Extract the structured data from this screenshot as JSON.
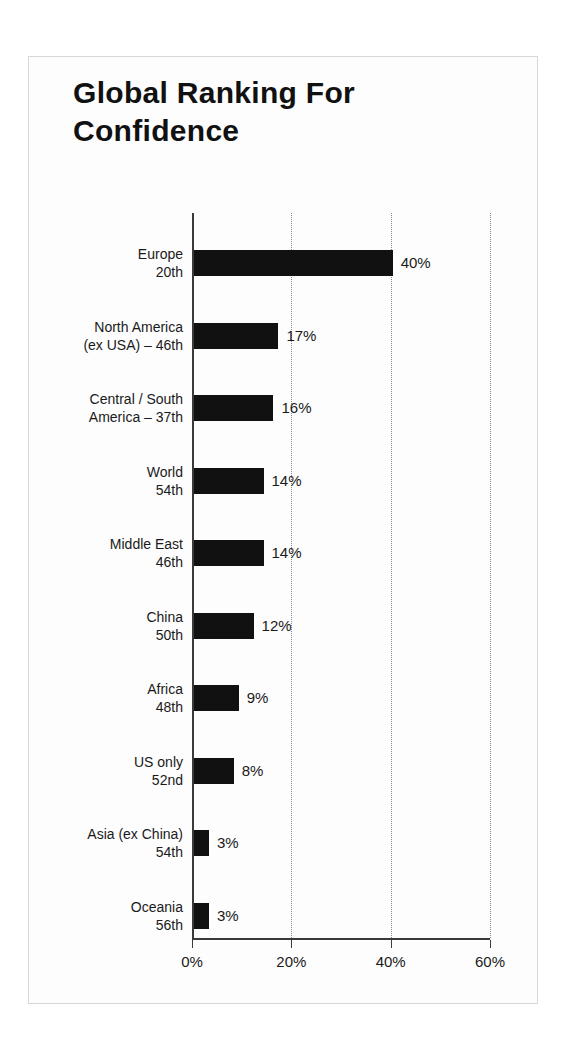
{
  "chart_data": {
    "type": "bar",
    "orientation": "horizontal",
    "title": "Global Ranking For\nConfidence",
    "xlabel": "",
    "ylabel": "",
    "xlim": [
      0,
      60
    ],
    "grid": true,
    "legend": null,
    "xticks": [
      {
        "value": 0,
        "label": "0%"
      },
      {
        "value": 20,
        "label": "20%"
      },
      {
        "value": 40,
        "label": "40%"
      },
      {
        "value": 60,
        "label": "60%"
      }
    ],
    "categories": [
      "Europe\n20th",
      "North America\n(ex USA) – 46th",
      "Central / South\nAmerica – 37th",
      "World\n54th",
      "Middle East\n46th",
      "China\n50th",
      "Africa\n48th",
      "US only\n52nd",
      "Asia (ex China)\n54th",
      "Oceania\n56th"
    ],
    "values": [
      40,
      17,
      16,
      14,
      14,
      12,
      9,
      8,
      3,
      3
    ],
    "value_labels": [
      "40%",
      "17%",
      "16%",
      "14%",
      "14%",
      "12%",
      "9%",
      "8%",
      "3%",
      "3%"
    ],
    "bar_color": "#111111",
    "background_color": "#fdfdfd",
    "axis_color": "#3a3a3a",
    "gridline_color": "#888888"
  }
}
